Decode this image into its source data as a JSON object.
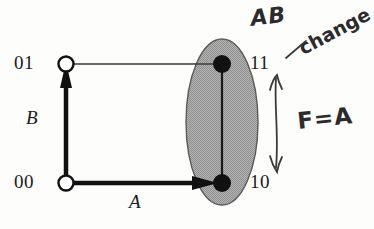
{
  "figure": {
    "type": "state-transition-diagram",
    "background_color": "#fdfdfc",
    "ink_color": "#1a1a1a",
    "ellipse_fill_color": "#a9a9a9",
    "ellipse_stroke_color": "#555555",
    "handwriting_color": "#2b2b2b"
  },
  "nodes": [
    {
      "id": "01",
      "label": "01",
      "style": "open-circle",
      "x": 66,
      "y": 64
    },
    {
      "id": "00",
      "label": "00",
      "style": "open-circle",
      "x": 66,
      "y": 183
    },
    {
      "id": "11",
      "label": "11",
      "style": "filled-dot",
      "x": 222,
      "y": 64
    },
    {
      "id": "10",
      "label": "10",
      "style": "filled-dot",
      "x": 222,
      "y": 183
    }
  ],
  "edges": [
    {
      "from": "00",
      "to": "01",
      "style": "thick-arrow",
      "orientation": "vertical",
      "label": "B"
    },
    {
      "from": "00",
      "to": "10",
      "style": "thick-arrow",
      "orientation": "horizontal",
      "label": "A"
    },
    {
      "from": "01",
      "to": "11",
      "style": "thin-line",
      "orientation": "horizontal",
      "label": ""
    },
    {
      "from": "11",
      "to": "10",
      "style": "thin-line",
      "orientation": "vertical",
      "label": ""
    }
  ],
  "axis_labels": {
    "vertical": "B",
    "horizontal": "A"
  },
  "state_labels": {
    "top_left": "01",
    "bottom_left": "00",
    "top_right": "11",
    "bottom_right": "10"
  },
  "highlight_region": {
    "shape": "ellipse",
    "center_x": 222,
    "center_y": 122,
    "radius_x": 36,
    "radius_y": 83,
    "contains": [
      "11",
      "10"
    ]
  },
  "annotations": [
    {
      "name": "ab-note",
      "text": "AB",
      "style": "handwritten"
    },
    {
      "name": "change-note",
      "text": "change",
      "style": "handwritten-clipped"
    },
    {
      "name": "f-equals-a-note",
      "text": "F=A",
      "style": "handwritten"
    },
    {
      "name": "vertical-double-arrow",
      "text": "",
      "style": "handwritten-arrow"
    },
    {
      "name": "pointer-tick",
      "text": "",
      "style": "handwritten-stroke"
    }
  ]
}
